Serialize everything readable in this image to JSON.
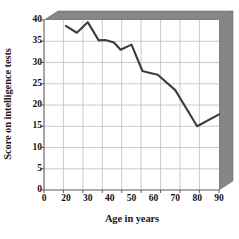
{
  "chart_data": {
    "type": "line",
    "title": "",
    "xlabel": "Age in years",
    "ylabel": "Score on intelligence tests",
    "xlim": [
      0,
      90
    ],
    "ylim": [
      0,
      40
    ],
    "grid": true,
    "legend": false,
    "legend_position": "none",
    "x_tick_labels": [
      "0",
      "20",
      "30",
      "40",
      "50",
      "60",
      "70",
      "80",
      "90"
    ],
    "x_tick_values": [
      0,
      20,
      30,
      40,
      50,
      60,
      70,
      80,
      90
    ],
    "y_tick_labels": [
      "0",
      "5",
      "10",
      "15",
      "20",
      "25",
      "30",
      "35",
      "40"
    ],
    "y_tick_values": [
      0,
      5,
      10,
      15,
      20,
      25,
      30,
      35,
      40
    ],
    "x": [
      20,
      25,
      30,
      35,
      38,
      42,
      45,
      50,
      55,
      58,
      62,
      70,
      80,
      90
    ],
    "values": [
      38.6,
      37.0,
      39.5,
      35.2,
      35.3,
      34.7,
      33.0,
      34.2,
      28.0,
      27.6,
      27.1,
      23.5,
      15.0,
      17.8
    ],
    "series": [
      {
        "name": "Score on intelligence tests",
        "color": "#3d3d3d",
        "values": [
          38.6,
          37.0,
          39.5,
          35.2,
          35.3,
          34.7,
          33.0,
          34.2,
          28.0,
          27.6,
          27.1,
          23.5,
          15.0,
          17.8
        ]
      }
    ],
    "colors": {
      "line": "#3d3d3d",
      "grid": "#b8bcc4",
      "axis": "#6f6f6f",
      "panel_shadow": "#828282",
      "plot_background": "#ffffff",
      "text": "#111111"
    }
  }
}
